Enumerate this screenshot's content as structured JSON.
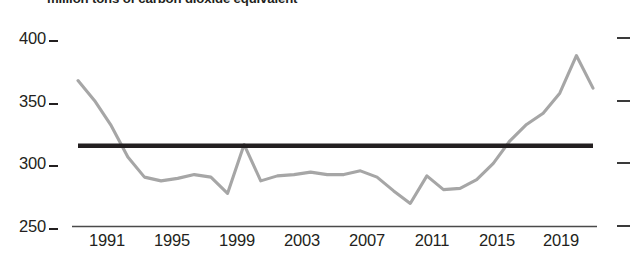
{
  "title": "million tons of carbon dioxide equivalent",
  "axis": {
    "y_ticks": [
      "400",
      "350",
      "300",
      "250"
    ],
    "y_tick_values": [
      400,
      350,
      300,
      250
    ],
    "x_ticks": [
      "1991",
      "1995",
      "1999",
      "2003",
      "2007",
      "2011",
      "2015",
      "2019"
    ],
    "x_tick_values": [
      1991,
      1995,
      1999,
      2003,
      2007,
      2011,
      2015,
      2019
    ]
  },
  "colors": {
    "series": "#a6a6a6",
    "reference": "#231f20",
    "axis": "#4a4a4a",
    "text": "#231f20",
    "background": "#ffffff"
  },
  "chart_data": {
    "type": "line",
    "title": "million tons of carbon dioxide equivalent",
    "xlabel": "",
    "ylabel": "million tons of carbon dioxide equivalent",
    "xlim": [
      1989,
      2020
    ],
    "ylim": [
      245,
      405
    ],
    "ytick_values": [
      400,
      350,
      300,
      250
    ],
    "xtick_values": [
      1991,
      1995,
      1999,
      2003,
      2007,
      2011,
      2015,
      2019
    ],
    "grid": false,
    "legend": false,
    "series": [
      {
        "name": "emissions",
        "color": "#a6a6a6",
        "x": [
          1989,
          1990,
          1991,
          1992,
          1993,
          1994,
          1995,
          1996,
          1997,
          1998,
          1999,
          2000,
          2001,
          2002,
          2003,
          2004,
          2005,
          2006,
          2007,
          2008,
          2009,
          2010,
          2011,
          2012,
          2013,
          2014,
          2015,
          2016,
          2017,
          2018,
          2019,
          2020
        ],
        "values": [
          366,
          350,
          330,
          305,
          289,
          286,
          288,
          291,
          289,
          276,
          315,
          286,
          290,
          291,
          293,
          291,
          291,
          294,
          289,
          278,
          268,
          290,
          279,
          280,
          287,
          300,
          318,
          331,
          340,
          356,
          386,
          360
        ]
      }
    ],
    "reference_lines": [
      {
        "name": "average",
        "orientation": "horizontal",
        "value": 314,
        "color": "#231f20",
        "x_start": 1989,
        "x_end": 2020
      }
    ]
  }
}
